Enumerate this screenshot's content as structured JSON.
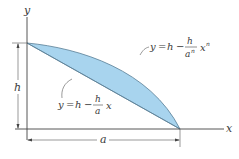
{
  "figure": {
    "axes": {
      "x_label": "x",
      "y_label": "y"
    },
    "dimensions": {
      "height_label": "h",
      "width_label": "a"
    },
    "curves": {
      "upper": {
        "y": "y",
        "eq": "=",
        "h": "h",
        "minus": "−",
        "frac_num": "h",
        "frac_den": "a",
        "frac_den_exp": "n",
        "x": "x",
        "x_exp": "n"
      },
      "lower": {
        "y": "y",
        "eq": "=",
        "h": "h",
        "minus": "−",
        "frac_num": "h",
        "frac_den": "a",
        "x": "x"
      }
    },
    "colors": {
      "fill": "#a8d4ee",
      "stroke": "#3a3a3a"
    }
  }
}
